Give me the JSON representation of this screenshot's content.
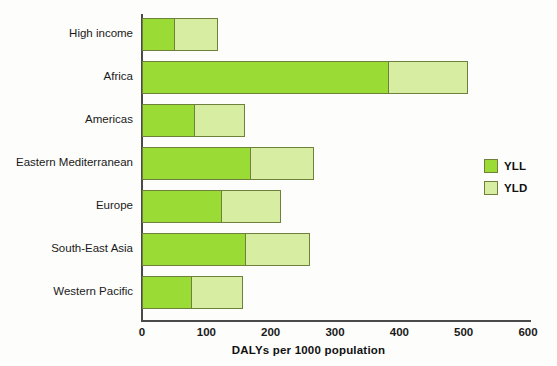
{
  "chart_data": {
    "type": "bar",
    "orientation": "horizontal",
    "stacked": true,
    "title": "",
    "xlabel": "DALYs per 1000 population",
    "ylabel": "",
    "xlim": [
      0,
      600
    ],
    "xticks": [
      0,
      100,
      200,
      300,
      400,
      500,
      600
    ],
    "xtick_labels": [
      "0",
      "100",
      "200",
      "300",
      "400",
      "500",
      "600"
    ],
    "grid": false,
    "legend_position": "right",
    "categories": [
      "High income",
      "Africa",
      "Americas",
      "Eastern Mediterranean",
      "Europe",
      "South-East Asia",
      "Western Pacific"
    ],
    "series": [
      {
        "name": "YLL",
        "color": "#9BDB35",
        "values": [
          52,
          384,
          83,
          169,
          125,
          161,
          78
        ]
      },
      {
        "name": "YLD",
        "color": "#D6EDA2",
        "values": [
          68,
          125,
          78,
          100,
          92,
          101,
          80
        ]
      }
    ],
    "totals": [
      120,
      509,
      161,
      269,
      217,
      262,
      158
    ]
  },
  "legend": {
    "items": [
      {
        "label": "YLL",
        "color": "#9BDB35"
      },
      {
        "label": "YLD",
        "color": "#D6EDA2"
      }
    ]
  },
  "axis": {
    "x_title": "DALYs per 1000 population"
  }
}
